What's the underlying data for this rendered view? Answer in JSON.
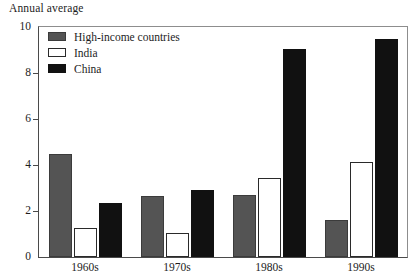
{
  "chart_data": {
    "type": "bar",
    "title": "Annual average",
    "subtitle": "",
    "xlabel": "",
    "ylabel": "",
    "categories": [
      "1960s",
      "1970s",
      "1980s",
      "1990s"
    ],
    "series": [
      {
        "name": "High-income countries",
        "color": "#545454",
        "values": [
          4.5,
          2.65,
          2.7,
          1.6
        ]
      },
      {
        "name": "India",
        "color": "#ffffff",
        "values": [
          1.25,
          1.05,
          3.45,
          4.15
        ]
      },
      {
        "name": "China",
        "color": "#111111",
        "values": [
          2.35,
          2.9,
          9.05,
          9.5
        ]
      }
    ],
    "ylim": [
      0,
      10
    ],
    "yticks": [
      0,
      2,
      4,
      6,
      8,
      10
    ],
    "ytick_labels": [
      "0",
      "2",
      "4",
      "6",
      "8",
      "10"
    ],
    "grid": false,
    "legend_position": "top-left-inside",
    "orientation": "vertical",
    "grouping": "grouped"
  },
  "axes": {
    "y_tick_labels": [
      "10",
      "8",
      "6",
      "4",
      "2",
      "0"
    ],
    "x_tick_labels": [
      "1960s",
      "1970s",
      "1980s",
      "1990s"
    ]
  },
  "legend": {
    "items": [
      {
        "label": "High-income countries",
        "swatch": "gray-filled-swatch"
      },
      {
        "label": "India",
        "swatch": "white-outlined-swatch"
      },
      {
        "label": "China",
        "swatch": "black-filled-swatch"
      }
    ]
  }
}
